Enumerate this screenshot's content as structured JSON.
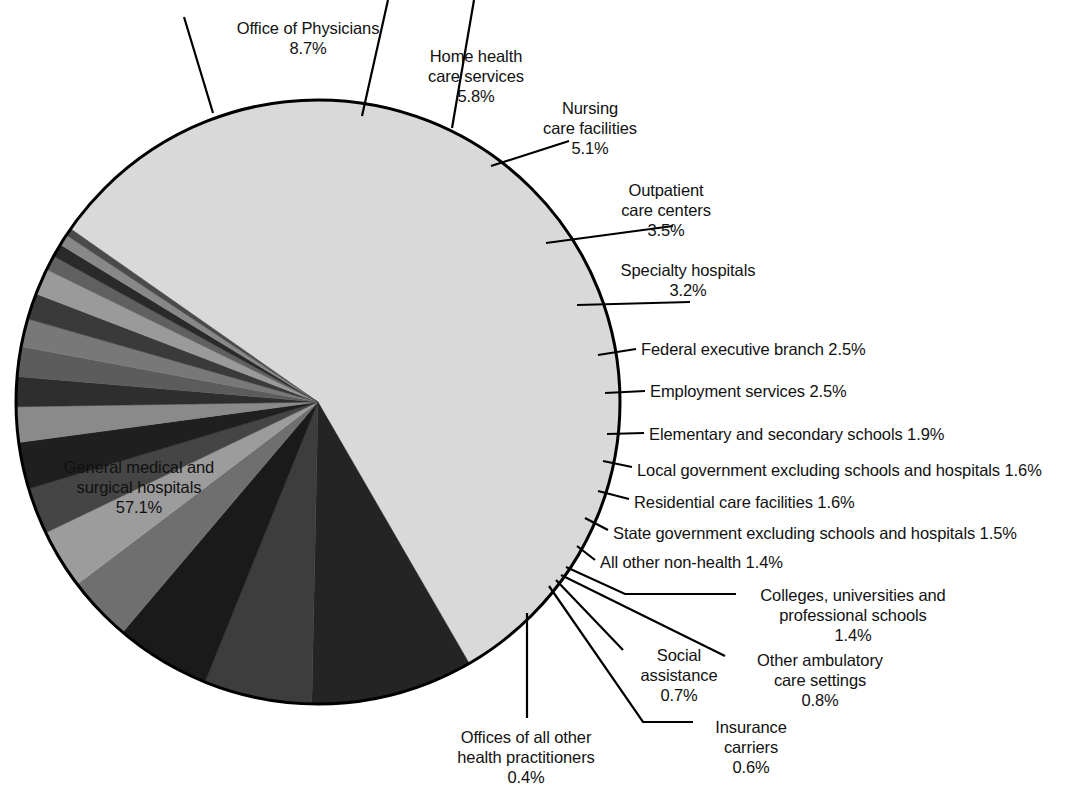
{
  "chart_data": {
    "type": "pie",
    "title": "",
    "subtitle": "",
    "xlabel": "",
    "ylabel": "",
    "legend_position": "none",
    "grid": false,
    "units": "percent",
    "start_angle_deg": -55,
    "direction": "clockwise",
    "categories": [
      "General medical and surgical hospitals",
      "Office of Physicians",
      "Home health care services",
      "Nursing care facilities",
      "Outpatient care centers",
      "Specialty hospitals",
      "Federal executive branch",
      "Employment services",
      "Elementary and secondary schools",
      "Local government excluding schools and hospitals",
      "Residential care facilities",
      "State government excluding schools and hospitals",
      "All other non-health",
      "Colleges, universities and professional schools",
      "Other ambulatory care settings",
      "Social assistance",
      "Insurance carriers",
      "Offices of all other health practitioners"
    ],
    "values": [
      57.1,
      8.7,
      5.8,
      5.1,
      3.5,
      3.2,
      2.5,
      2.5,
      1.9,
      1.6,
      1.6,
      1.5,
      1.4,
      1.4,
      0.8,
      0.7,
      0.6,
      0.4
    ],
    "slice_colors": [
      "#d9d9d9",
      "#242424",
      "#3d3d3d",
      "#1a1a1a",
      "#6f6f6f",
      "#9c9c9c",
      "#454545",
      "#1f1f1f",
      "#8a8a8a",
      "#2e2e2e",
      "#5c5c5c",
      "#787878",
      "#3a3a3a",
      "#9a9a9a",
      "#606060",
      "#2a2a2a",
      "#888888",
      "#4a4a4a"
    ]
  },
  "labels": [
    {
      "id": "office-of-physicians",
      "name": "Office of Physicians",
      "value": "8.7%",
      "lines": [
        "Office of Physicians",
        "8.7%"
      ]
    },
    {
      "id": "home-health-care-services",
      "name": "Home health care services",
      "value": "5.8%",
      "lines": [
        "Home health",
        "care services",
        "5.8%"
      ]
    },
    {
      "id": "nursing-care-facilities",
      "name": "Nursing care facilities",
      "value": "5.1%",
      "lines": [
        "Nursing",
        "care facilities",
        "5.1%"
      ]
    },
    {
      "id": "outpatient-care-centers",
      "name": "Outpatient care centers",
      "value": "3.5%",
      "lines": [
        "Outpatient",
        "care centers",
        "3.5%"
      ]
    },
    {
      "id": "specialty-hospitals",
      "name": "Specialty hospitals",
      "value": "3.2%",
      "lines": [
        "Specialty hospitals",
        "3.2%"
      ]
    },
    {
      "id": "federal-executive-branch",
      "name": "Federal executive branch",
      "value": "2.5%",
      "lines": [
        "Federal executive branch 2.5%"
      ]
    },
    {
      "id": "employment-services",
      "name": "Employment services",
      "value": "2.5%",
      "lines": [
        "Employment services 2.5%"
      ]
    },
    {
      "id": "elementary-and-secondary-schools",
      "name": "Elementary and secondary schools",
      "value": "1.9%",
      "lines": [
        "Elementary and secondary schools 1.9%"
      ]
    },
    {
      "id": "local-government-excluding-schools-and-hospitals",
      "name": "Local government excluding schools and hospitals",
      "value": "1.6%",
      "lines": [
        "Local government excluding schools and hospitals 1.6%"
      ]
    },
    {
      "id": "residential-care-facilities",
      "name": "Residential care facilities",
      "value": "1.6%",
      "lines": [
        "Residential care facilities 1.6%"
      ]
    },
    {
      "id": "state-government-excluding-schools-and-hospitals",
      "name": "State government excluding schools and hospitals",
      "value": "1.5%",
      "lines": [
        "State government excluding schools and hospitals 1.5%"
      ]
    },
    {
      "id": "all-other-non-health",
      "name": "All other non-health",
      "value": "1.4%",
      "lines": [
        "All other non-health 1.4%"
      ]
    },
    {
      "id": "colleges-universities-and-professional-schools",
      "name": "Colleges, universities and professional schools",
      "value": "1.4%",
      "lines": [
        "Colleges, universities and",
        "professional schools",
        "1.4%"
      ]
    },
    {
      "id": "other-ambulatory-care-settings",
      "name": "Other ambulatory care settings",
      "value": "0.8%",
      "lines": [
        "Other ambulatory",
        "care settings",
        "0.8%"
      ]
    },
    {
      "id": "social-assistance",
      "name": "Social assistance",
      "value": "0.7%",
      "lines": [
        "Social",
        "assistance",
        "0.7%"
      ]
    },
    {
      "id": "insurance-carriers",
      "name": "Insurance carriers",
      "value": "0.6%",
      "lines": [
        "Insurance",
        "carriers",
        "0.6%"
      ]
    },
    {
      "id": "offices-of-all-other-health-practitioners",
      "name": "Offices of all other health practitioners",
      "value": "0.4%",
      "lines": [
        "Offices of all other",
        "health practitioners",
        "0.4%"
      ]
    },
    {
      "id": "general-medical-and-surgical-hospitals",
      "name": "General medical and surgical hospitals",
      "value": "57.1%",
      "lines": [
        "General medical and",
        "surgical hospitals",
        "57.1%"
      ]
    }
  ],
  "label_positions": [
    {
      "id": "office-of-physicians",
      "x": 224,
      "y": 18,
      "w": 168,
      "align": "center"
    },
    {
      "id": "home-health-care-services",
      "x": 410,
      "y": 46,
      "w": 132,
      "align": "center"
    },
    {
      "id": "nursing-care-facilities",
      "x": 528,
      "y": 98,
      "w": 124,
      "align": "center"
    },
    {
      "id": "outpatient-care-centers",
      "x": 604,
      "y": 180,
      "w": 124,
      "align": "center"
    },
    {
      "id": "specialty-hospitals",
      "x": 612,
      "y": 260,
      "w": 152,
      "align": "center"
    },
    {
      "id": "federal-executive-branch",
      "x": 641,
      "y": 339,
      "w": 280,
      "align": "left"
    },
    {
      "id": "employment-services",
      "x": 650,
      "y": 381,
      "w": 260,
      "align": "left"
    },
    {
      "id": "elementary-and-secondary-schools",
      "x": 649,
      "y": 424,
      "w": 360,
      "align": "left"
    },
    {
      "id": "local-government-excluding-schools-and-hospitals",
      "x": 637,
      "y": 460,
      "w": 455,
      "align": "left"
    },
    {
      "id": "residential-care-facilities",
      "x": 634,
      "y": 492,
      "w": 320,
      "align": "left"
    },
    {
      "id": "state-government-excluding-schools-and-hospitals",
      "x": 613,
      "y": 523,
      "w": 470,
      "align": "left"
    },
    {
      "id": "all-other-non-health",
      "x": 600,
      "y": 552,
      "w": 280,
      "align": "left"
    },
    {
      "id": "colleges-universities-and-professional-schools",
      "x": 743,
      "y": 585,
      "w": 220,
      "align": "center"
    },
    {
      "id": "other-ambulatory-care-settings",
      "x": 739,
      "y": 650,
      "w": 162,
      "align": "center"
    },
    {
      "id": "social-assistance",
      "x": 629,
      "y": 645,
      "w": 100,
      "align": "center"
    },
    {
      "id": "insurance-carriers",
      "x": 699,
      "y": 717,
      "w": 104,
      "align": "center"
    },
    {
      "id": "offices-of-all-other-health-practitioners",
      "x": 443,
      "y": 727,
      "w": 166,
      "align": "center"
    },
    {
      "id": "general-medical-and-surgical-hospitals",
      "x": 46,
      "y": 457,
      "w": 186,
      "align": "center"
    }
  ],
  "leader_lines": [
    {
      "id": "leader-office-of-physicians",
      "points": "184,17 213,113"
    },
    {
      "id": "leader-office-of-physicians-b",
      "points": "388,0 362,116"
    },
    {
      "id": "leader-home-health-care-services",
      "points": "474,0 452,128"
    },
    {
      "id": "leader-nursing-care-facilities",
      "points": "569,141 491,166"
    },
    {
      "id": "leader-outpatient-care-centers",
      "points": "673,226 546,243"
    },
    {
      "id": "leader-specialty-hospitals",
      "points": "690,302 577,305"
    },
    {
      "id": "leader-federal-executive-branch",
      "points": "636,349 598,355"
    },
    {
      "id": "leader-employment-services",
      "points": "645,391 605,393"
    },
    {
      "id": "leader-elementary-and-secondary-schools",
      "points": "644,433 607,434"
    },
    {
      "id": "leader-local-government",
      "points": "632,467 603,461"
    },
    {
      "id": "leader-residential-care-facilities",
      "points": "629,499 598,491"
    },
    {
      "id": "leader-state-government",
      "points": "608,530 585,518"
    },
    {
      "id": "leader-all-other-non-health",
      "points": "595,560 577,546"
    },
    {
      "id": "leader-colleges",
      "points": "736,594 625,594 566,567"
    },
    {
      "id": "leader-other-ambulatory",
      "points": "725,656 561,575"
    },
    {
      "id": "leader-social-assistance",
      "points": "623,650 556,580"
    },
    {
      "id": "leader-insurance-carriers",
      "points": "693,722 643,722 549,586"
    },
    {
      "id": "leader-offices-of-all-other-health-practitioners",
      "points": "527,718 527,613"
    }
  ],
  "pie_geometry": {
    "cx": 318,
    "cy": 402,
    "r": 302,
    "outline_color": "#000000",
    "outline_width": 3
  }
}
